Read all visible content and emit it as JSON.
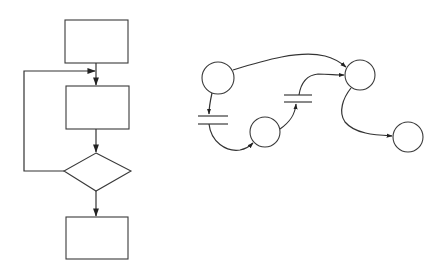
{
  "figure": {
    "stroke_color": "#333333",
    "background": "#ffffff"
  },
  "flowchart": {
    "nodes": [
      {
        "id": "process-1",
        "type": "rectangle",
        "label": ""
      },
      {
        "id": "process-2",
        "type": "rectangle",
        "label": ""
      },
      {
        "id": "decision",
        "type": "diamond",
        "label": ""
      },
      {
        "id": "process-3",
        "type": "rectangle",
        "label": ""
      }
    ],
    "edges": [
      {
        "from": "process-1",
        "to": "process-2",
        "arrow": true
      },
      {
        "from": "process-2",
        "to": "decision",
        "arrow": true
      },
      {
        "from": "decision",
        "to": "process-3",
        "arrow": true
      },
      {
        "from": "decision",
        "to": "process-2",
        "arrow": true,
        "kind": "loop-back"
      }
    ]
  },
  "petri_net": {
    "places": [
      {
        "id": "place-a",
        "label": ""
      },
      {
        "id": "place-b",
        "label": ""
      },
      {
        "id": "place-c",
        "label": ""
      },
      {
        "id": "place-d",
        "label": ""
      }
    ],
    "transitions": [
      {
        "id": "transition-1",
        "label": ""
      },
      {
        "id": "transition-2",
        "label": ""
      }
    ],
    "arcs": [
      {
        "from": "place-a",
        "to": "place-c",
        "arrow": true
      },
      {
        "from": "place-a",
        "to": "transition-1",
        "arrow": true
      },
      {
        "from": "transition-1",
        "to": "place-b",
        "arrow": true
      },
      {
        "from": "place-b",
        "to": "transition-2",
        "arrow": true
      },
      {
        "from": "transition-2",
        "to": "place-c",
        "arrow": true
      },
      {
        "from": "place-c",
        "to": "place-d",
        "arrow": true
      }
    ]
  }
}
